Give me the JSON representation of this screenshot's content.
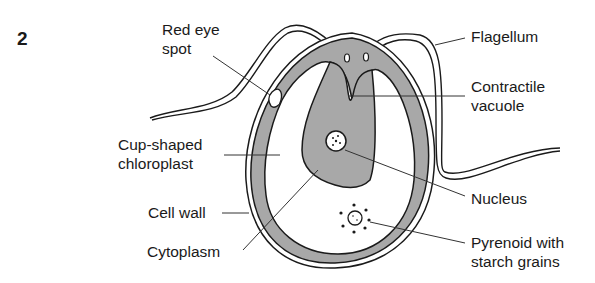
{
  "figure": {
    "number": "2",
    "colors": {
      "cytoplasm_fill": "#a8a8a8",
      "outline": "#1a1a1a",
      "background": "#ffffff"
    }
  },
  "labels": {
    "red_eye_spot": [
      "Red eye",
      "spot"
    ],
    "flagellum": [
      "Flagellum"
    ],
    "contractile_vacuole": [
      "Contractile",
      "vacuole"
    ],
    "cup_shaped_chloroplast": [
      "Cup-shaped",
      "chloroplast"
    ],
    "cell_wall": [
      "Cell wall"
    ],
    "cytoplasm": [
      "Cytoplasm"
    ],
    "nucleus": [
      "Nucleus"
    ],
    "pyrenoid": [
      "Pyrenoid with",
      "starch grains"
    ]
  }
}
